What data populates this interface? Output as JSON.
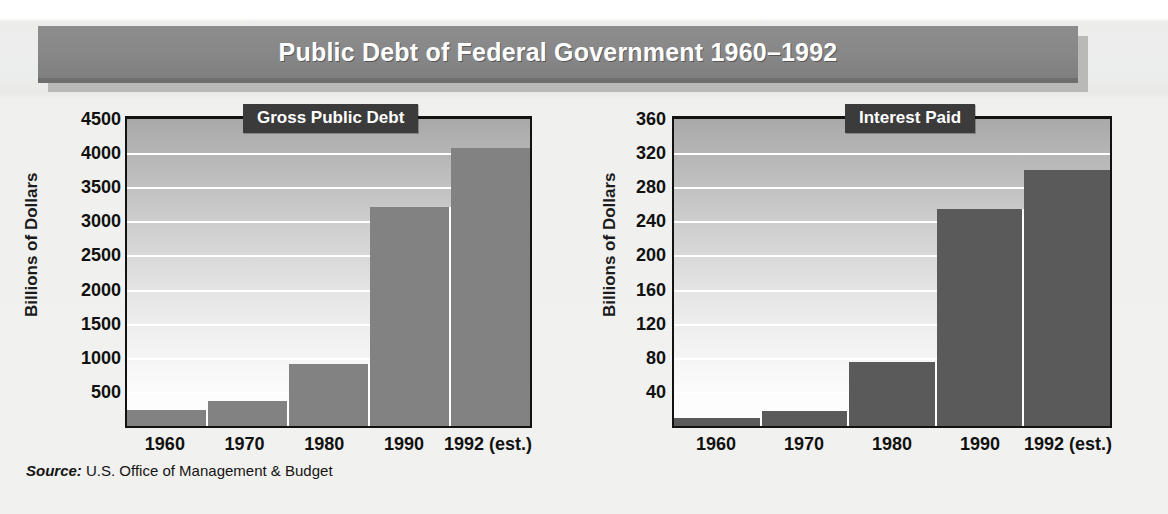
{
  "header": {
    "title": "Public Debt of Federal Government 1960–1992"
  },
  "source": {
    "label": "Source:",
    "text": " U.S. Office of Management & Budget"
  },
  "colors": {
    "banner": "#878787",
    "badge": "#3b3b3b",
    "bar_left": "#828282",
    "bar_right": "#5a5a5a",
    "gridline": "#ffffff",
    "axis": "#121212"
  },
  "chart_data": [
    {
      "type": "bar",
      "title": "Gross Public Debt",
      "xlabel": "",
      "ylabel": "Billions of Dollars",
      "categories": [
        "1960",
        "1970",
        "1980",
        "1990",
        "1992 (est.)"
      ],
      "values": [
        237,
        371,
        908,
        3207,
        4075
      ],
      "ylim": [
        0,
        4500
      ],
      "yticks": [
        4500,
        4000,
        3500,
        3000,
        2500,
        2000,
        1500,
        1000,
        500
      ],
      "grid": true,
      "legend": "none",
      "bar_color": "#828282"
    },
    {
      "type": "bar",
      "title": "Interest Paid",
      "xlabel": "",
      "ylabel": "Billions of Dollars",
      "categories": [
        "1960",
        "1970",
        "1980",
        "1990",
        "1992 (est.)"
      ],
      "values": [
        9,
        18,
        75,
        255,
        300
      ],
      "ylim": [
        0,
        360
      ],
      "yticks": [
        360,
        320,
        280,
        240,
        200,
        160,
        120,
        80,
        40
      ],
      "grid": true,
      "legend": "none",
      "bar_color": "#5a5a5a"
    }
  ]
}
